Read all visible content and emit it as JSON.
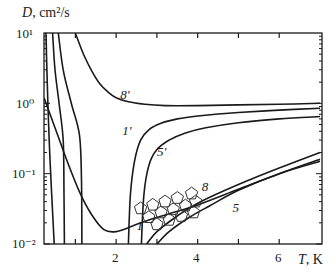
{
  "chart_data": {
    "type": "line",
    "title": "",
    "xlabel": "T, K",
    "ylabel": "D, cm²/s",
    "xscale": "linear",
    "yscale": "log",
    "xlim": [
      0.23,
      7.05
    ],
    "ylim": [
      0.01,
      10
    ],
    "x_ticks": [
      1,
      2,
      3,
      4,
      5,
      6
    ],
    "x_tick_labels": [
      "",
      "2",
      "",
      "4",
      "",
      "6"
    ],
    "y_tick_labels": [
      "10^-2",
      "10^-1",
      "10^0",
      "10^1"
    ],
    "grid": false,
    "legend": "inline curve labels",
    "series": [
      {
        "name": "8'",
        "label_pos": [
          2.2,
          1.3
        ],
        "x": [
          1.0,
          1.2,
          1.4,
          1.6,
          1.8,
          2.0,
          2.3,
          2.7,
          3.2,
          4.0,
          5.0,
          6.0,
          7.0
        ],
        "values": [
          10,
          5.0,
          2.9,
          1.9,
          1.45,
          1.2,
          1.05,
          0.97,
          0.93,
          0.93,
          0.95,
          0.97,
          1.0
        ]
      },
      {
        "name": "1'",
        "label_pos": [
          2.25,
          0.4
        ],
        "x": [
          2.3,
          2.35,
          2.45,
          2.6,
          2.8,
          3.1,
          3.5,
          4.0,
          5.0,
          6.0,
          7.0
        ],
        "values": [
          0.01,
          0.05,
          0.15,
          0.3,
          0.42,
          0.52,
          0.6,
          0.66,
          0.74,
          0.8,
          0.85
        ]
      },
      {
        "name": "5'",
        "label_pos": [
          3.1,
          0.2
        ],
        "x": [
          2.62,
          2.68,
          2.8,
          3.0,
          3.3,
          3.7,
          4.2,
          5.0,
          6.0,
          7.0
        ],
        "values": [
          0.01,
          0.05,
          0.13,
          0.22,
          0.3,
          0.38,
          0.45,
          0.53,
          0.6,
          0.65
        ]
      },
      {
        "name": "1",
        "label_pos": [
          2.6,
          0.018
        ],
        "x": [
          0.23,
          0.5,
          0.8,
          1.1,
          1.4,
          1.7,
          2.0,
          2.4,
          2.8,
          3.3,
          4.0,
          5.0,
          6.0,
          7.0
        ],
        "values": [
          1.2,
          0.45,
          0.15,
          0.055,
          0.026,
          0.016,
          0.015,
          0.018,
          0.022,
          0.027,
          0.036,
          0.06,
          0.1,
          0.16
        ]
      },
      {
        "name": "8",
        "label_pos": [
          4.2,
          0.065
        ],
        "x": [
          2.75,
          3.0,
          3.5,
          4.0,
          5.0,
          6.0,
          7.0
        ],
        "values": [
          0.01,
          0.015,
          0.025,
          0.038,
          0.07,
          0.12,
          0.2
        ]
      },
      {
        "name": "5",
        "label_pos": [
          4.95,
          0.033
        ],
        "x": [
          3.0,
          3.3,
          3.8,
          4.3,
          5.0,
          6.0,
          7.0
        ],
        "values": [
          0.01,
          0.015,
          0.024,
          0.035,
          0.058,
          0.1,
          0.15
        ]
      },
      {
        "name": "left-steep-1",
        "label_pos": null,
        "x": [
          0.28,
          0.3,
          0.33,
          0.37,
          0.42,
          0.48
        ],
        "values": [
          10,
          3,
          0.8,
          0.2,
          0.05,
          0.01
        ]
      },
      {
        "name": "left-vertical-1",
        "label_pos": null,
        "x": [
          0.44,
          0.5,
          0.6,
          0.7,
          0.72,
          0.73
        ],
        "values": [
          10,
          3,
          1,
          0.3,
          0.05,
          0.01
        ]
      },
      {
        "name": "left-vertical-2",
        "label_pos": null,
        "x": [
          0.58,
          0.7,
          0.9,
          1.1,
          1.15,
          1.16
        ],
        "values": [
          10,
          3,
          1,
          0.35,
          0.08,
          0.01
        ]
      }
    ],
    "markers": {
      "shape": "pentagon",
      "points": [
        [
          2.6,
          0.032
        ],
        [
          2.9,
          0.036
        ],
        [
          3.2,
          0.04
        ],
        [
          3.5,
          0.045
        ],
        [
          3.85,
          0.052
        ],
        [
          2.8,
          0.024
        ],
        [
          3.1,
          0.028
        ],
        [
          3.4,
          0.031
        ],
        [
          3.7,
          0.035
        ],
        [
          3.95,
          0.04
        ],
        [
          3.0,
          0.019
        ],
        [
          3.3,
          0.022
        ],
        [
          3.6,
          0.025
        ],
        [
          3.9,
          0.028
        ]
      ]
    }
  },
  "labels": {
    "ylabel_var": "D",
    "ylabel_unit": ", cm²/s",
    "xlabel_var": "T",
    "xlabel_unit": ", K",
    "y_ticks": [
      "10¹",
      "10⁰",
      "10⁻¹",
      "10⁻²"
    ],
    "x_ticks": [
      "2",
      "4",
      "6"
    ]
  }
}
